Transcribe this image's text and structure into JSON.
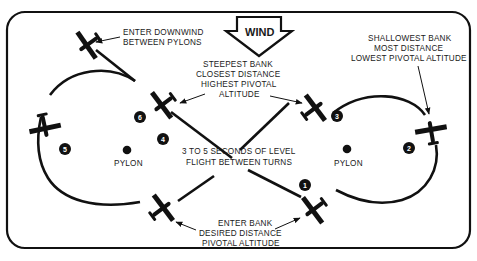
{
  "diagram": {
    "wind": {
      "label": "WIND",
      "direction": "down"
    },
    "pylons": [
      {
        "id": "left",
        "label": "PYLON"
      },
      {
        "id": "right",
        "label": "PYLON"
      }
    ],
    "annotations": {
      "enter_downwind": [
        "ENTER DOWNWIND",
        "BETWEEN PYLONS"
      ],
      "steepest_bank": [
        "STEEPEST BANK",
        "CLOSEST DISTANCE",
        "HIGHEST PIVOTAL",
        "ALTITUDE"
      ],
      "shallowest_bank": [
        "SHALLOWEST BANK",
        "MOST DISTANCE",
        "LOWEST PIVOTAL ALTITUDE"
      ],
      "level_flight": [
        "3 TO 5 SECONDS OF LEVEL",
        "FLIGHT BETWEEN TURNS"
      ],
      "enter_bank": [
        "ENTER BANK",
        "DESIRED DISTANCE",
        "PIVOTAL ALTITUDE"
      ]
    },
    "positions": [
      "1",
      "2",
      "3",
      "4",
      "5",
      "6"
    ],
    "colors": {
      "ink": "#111111",
      "background": "#ffffff"
    }
  }
}
